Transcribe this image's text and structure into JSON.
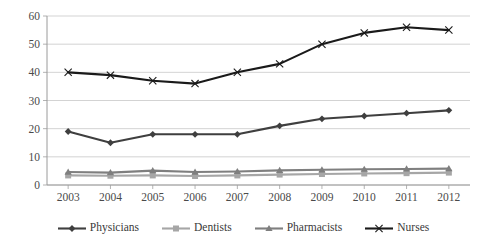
{
  "chart_data": {
    "type": "line",
    "title": "",
    "xlabel": "",
    "ylabel": "",
    "grid": true,
    "legend_position": "bottom",
    "ylim": [
      0,
      60
    ],
    "yticks": [
      0,
      10,
      20,
      30,
      40,
      50,
      60
    ],
    "categories": [
      "2003",
      "2004",
      "2005",
      "2006",
      "2007",
      "2008",
      "2009",
      "2010",
      "2011",
      "2012"
    ],
    "series": [
      {
        "name": "Physicians",
        "marker": "diamond",
        "color": "#3f3f3f",
        "values": [
          19,
          15,
          18,
          18,
          18,
          21,
          23.5,
          24.5,
          25.5,
          26.5
        ]
      },
      {
        "name": "Dentists",
        "marker": "square",
        "color": "#a6a6a6",
        "values": [
          3.4,
          3.3,
          3.4,
          3.2,
          3.4,
          3.7,
          3.9,
          4.1,
          4.2,
          4.4
        ]
      },
      {
        "name": "Pharmacists",
        "marker": "triangle",
        "color": "#7f7f7f",
        "values": [
          4.6,
          4.4,
          5.1,
          4.6,
          4.8,
          5.2,
          5.4,
          5.6,
          5.7,
          5.8
        ]
      },
      {
        "name": "Nurses",
        "marker": "x",
        "color": "#1a1a1a",
        "values": [
          40,
          39,
          37,
          36,
          40,
          43,
          50,
          54,
          56,
          55
        ]
      }
    ]
  },
  "legend": {
    "items": [
      {
        "label": "Physicians"
      },
      {
        "label": "Dentists"
      },
      {
        "label": "Pharmacists"
      },
      {
        "label": "Nurses"
      }
    ]
  }
}
